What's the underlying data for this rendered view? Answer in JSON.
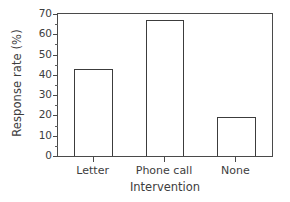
{
  "chart_data": {
    "type": "bar",
    "title": "",
    "categories": [
      "Letter",
      "Phone call",
      "None"
    ],
    "values": [
      43,
      67,
      19
    ],
    "xlabel": "Intervention",
    "ylabel": "Response rate (%)",
    "ylim": [
      0,
      70
    ],
    "ytick_labels": [
      "0",
      "10",
      "20",
      "30",
      "40",
      "50",
      "60",
      "70"
    ],
    "ytick_values": [
      0,
      10,
      20,
      30,
      40,
      50,
      60,
      70
    ],
    "yminor_step": 5,
    "grid": false,
    "legend": null,
    "bar_face_color": "#ffffff",
    "bar_edge_color": "#3c3c3c",
    "axis_color": "#4a4a4a",
    "background_color": "#ffffff"
  }
}
